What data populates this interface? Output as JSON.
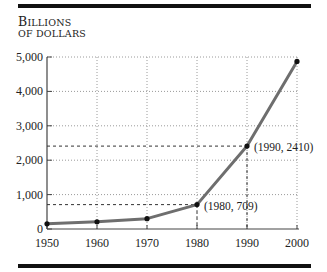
{
  "chart_data": {
    "type": "line",
    "title": "",
    "ylabel_line1": "Billions",
    "ylabel_line2": "of dollars",
    "xlabel": "",
    "x": [
      1950,
      1960,
      1970,
      1980,
      1990,
      2000
    ],
    "series": [
      {
        "name": "Billions of dollars",
        "values": [
          150,
          210,
          300,
          709,
          2410,
          4870
        ]
      }
    ],
    "xlim": [
      1950,
      2000
    ],
    "ylim": [
      0,
      5000
    ],
    "x_ticks": [
      "1950",
      "1960",
      "1970",
      "1980",
      "1990",
      "2000"
    ],
    "y_ticks": [
      "0",
      "1,000",
      "2,000",
      "3,000",
      "4,000",
      "5,000"
    ],
    "grid": "dotted",
    "annotations": [
      {
        "x": 1980,
        "y": 709,
        "label": "(1980, 709)"
      },
      {
        "x": 1990,
        "y": 2410,
        "label": "(1990, 2410)"
      }
    ],
    "line_color": "#6e6e6e"
  }
}
